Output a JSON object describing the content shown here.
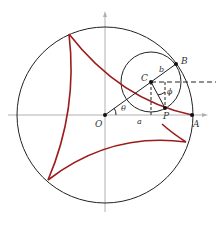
{
  "diagram": {
    "type": "hypocycloid (deltoid) construction",
    "colors": {
      "circle": "#222222",
      "curve": "#9b1c1c",
      "axis": "#aaaaaa",
      "construction": "#222222"
    },
    "labels": {
      "origin": "O",
      "point_a": "A",
      "point_b": "B",
      "point_c": "C",
      "point_p": "P",
      "radius_large": "a",
      "radius_small": "b",
      "angle_theta": "θ",
      "angle_phi": "ϕ"
    }
  }
}
